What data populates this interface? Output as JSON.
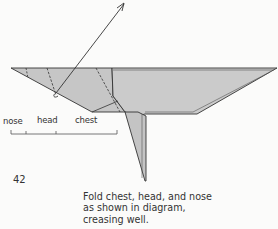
{
  "diagram": {
    "type": "origami-fold-instruction",
    "paper_color": "#c9c9c9",
    "line_color": "#333333",
    "labels": {
      "nose": "nose",
      "head": "head",
      "chest": "chest"
    },
    "step_number": "42",
    "caption": {
      "line1": "Fold chest, head, and nose",
      "line2": "as shown in diagram,",
      "line3": "creasing well."
    }
  }
}
